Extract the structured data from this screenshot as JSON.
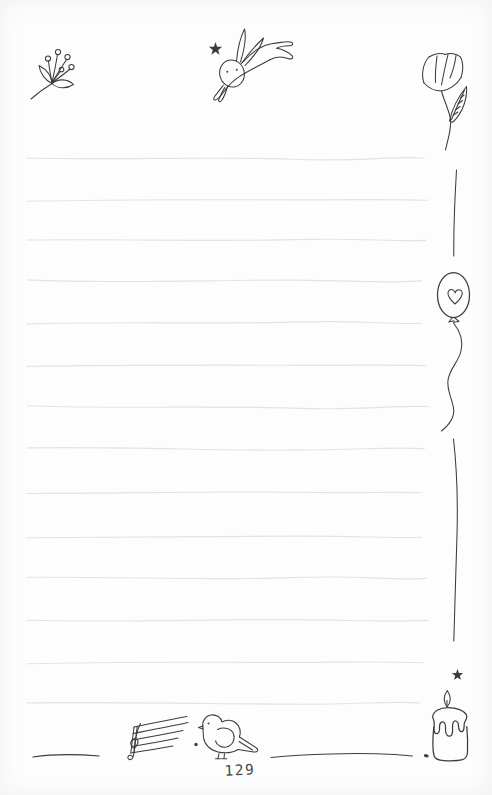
{
  "page": {
    "number": "129"
  },
  "colors": {
    "paper": "#fdfdfd",
    "ink": "#3c3c3c",
    "ink_soft": "#4a4a4a",
    "rule": "#e3e3e3"
  },
  "ruled_lines": {
    "x_start": 27,
    "x_end": 424,
    "y_positions": [
      158,
      199.5,
      240.5,
      281.5,
      323,
      365,
      407,
      449,
      492,
      537,
      579,
      620.5,
      662,
      703
    ]
  },
  "doodles": [
    {
      "name": "berry-sprig",
      "position": "top-left"
    },
    {
      "name": "sparkle-star",
      "position": "top-center"
    },
    {
      "name": "leaping-rabbit",
      "position": "top-center"
    },
    {
      "name": "tulip-flower",
      "position": "top-right"
    },
    {
      "name": "heart-balloon",
      "position": "right-margin"
    },
    {
      "name": "sparkle-star",
      "position": "right-margin-bottom"
    },
    {
      "name": "candle",
      "position": "bottom-right"
    },
    {
      "name": "music-staff",
      "position": "bottom-center"
    },
    {
      "name": "bird",
      "position": "bottom-center"
    }
  ]
}
